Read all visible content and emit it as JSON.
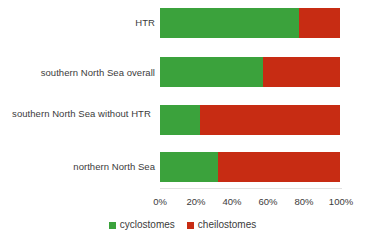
{
  "chart_data": {
    "type": "bar",
    "orientation": "horizontal",
    "stacked": true,
    "normalized": true,
    "title": "",
    "subtitle": "",
    "xlabel": "",
    "ylabel": "",
    "xlim": [
      0,
      100
    ],
    "xtick_labels": [
      "0%",
      "20%",
      "40%",
      "60%",
      "80%",
      "100%"
    ],
    "xtick_values": [
      0,
      20,
      40,
      60,
      80,
      100
    ],
    "grid": false,
    "legend_position": "bottom-center",
    "categories": [
      "HTR",
      "southern North Sea overall",
      "southern North Sea without HTR",
      "northern North Sea"
    ],
    "series": [
      {
        "name": "cyclostomes",
        "color": "#3ba23c",
        "values": [
          77,
          57,
          22,
          32
        ]
      },
      {
        "name": "cheilostomes",
        "color": "#c72c13",
        "values": [
          23,
          43,
          78,
          68
        ]
      }
    ]
  },
  "legend": {
    "entries": [
      {
        "label": "cyclostomes",
        "color": "#3ba23c"
      },
      {
        "label": "cheilostomes",
        "color": "#c72c13"
      }
    ]
  },
  "colors": {
    "cyclostomes": "#3ba23c",
    "cheilostomes": "#c72c13",
    "background": "#ffffff",
    "text": "#3b3b3b",
    "baseline": "#e2e2e2"
  }
}
